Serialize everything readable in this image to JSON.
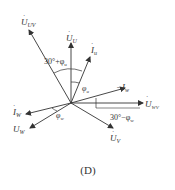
{
  "figure": {
    "caption": "(D)",
    "origin": [
      71,
      103
    ],
    "color": "#333333",
    "vectors": [
      {
        "name": "U_UV",
        "label_main": "U",
        "label_sub": "UV",
        "dot": true,
        "tip": [
          29,
          30
        ]
      },
      {
        "name": "U_U",
        "label_main": "U",
        "label_sub": "U",
        "dot": true,
        "tip": [
          71,
          43
        ]
      },
      {
        "name": "I_U",
        "label_main": "I",
        "label_sub": "u",
        "dot": true,
        "tip": [
          90,
          57
        ]
      },
      {
        "name": "-I_W",
        "label_main": "−I",
        "label_sub": "w",
        "dot": false,
        "tip": [
          125,
          88
        ]
      },
      {
        "name": "U_WV",
        "label_main": "U",
        "label_sub": "WV",
        "dot": true,
        "tip": [
          143,
          103
        ]
      },
      {
        "name": "U_V",
        "label_main": "U",
        "label_sub": "V",
        "dot": true,
        "tip": [
          113,
          128
        ]
      },
      {
        "name": "I_W",
        "label_main": "I",
        "label_sub": "W",
        "dot": true,
        "tip": [
          26,
          114
        ]
      },
      {
        "name": "U_W",
        "label_main": "U",
        "label_sub": "W",
        "dot": false,
        "tip": [
          30,
          128
        ]
      }
    ],
    "angles": [
      {
        "name": "angle-30-plus-phi-u",
        "text_main": "30°+φ",
        "text_sub": "u"
      },
      {
        "name": "angle-phi-u",
        "text_main": "φ",
        "text_sub": "u"
      },
      {
        "name": "angle-30-minus-phi-w",
        "text_main": "30°−φ",
        "text_sub": "w"
      },
      {
        "name": "angle-phi-w",
        "text_main": "φ",
        "text_sub": "w"
      }
    ]
  }
}
